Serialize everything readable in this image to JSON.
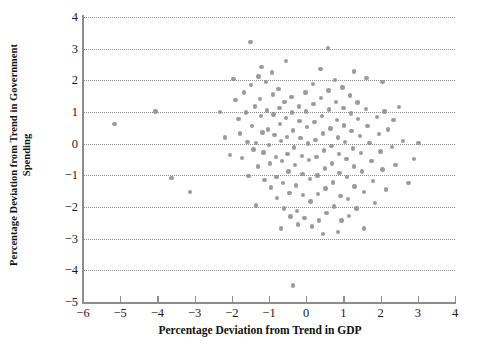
{
  "chart_data": {
    "type": "scatter",
    "title": "",
    "xlabel": "Percentage Deviation from Trend in GDP",
    "ylabel": "Percentage Deviation from Trend in Government Spending",
    "ylabel_line1": "Percentage Deviation from Trend in Government",
    "ylabel_line2": "Spending",
    "xlim": [
      -6,
      4
    ],
    "ylim": [
      -5,
      4
    ],
    "xticks": [
      -6,
      -5,
      -4,
      -3,
      -2,
      -1,
      0,
      1,
      2,
      3,
      4
    ],
    "yticks": [
      4,
      3,
      2,
      1,
      0,
      -1,
      -2,
      -3,
      -4,
      -5
    ],
    "xticklabels": [
      "−6",
      "−5",
      "−4",
      "−3",
      "−2",
      "−1",
      "0",
      "1",
      "2",
      "3",
      "4"
    ],
    "yticklabels": [
      "4",
      "3",
      "2",
      "1",
      "0",
      "−1",
      "−2",
      "−3",
      "−4",
      "−5"
    ],
    "grid": "horizontal-dotted",
    "legend": "none",
    "marker_color": "#8c8c94",
    "axis_color": "#8d8d8d",
    "grid_color": "#8a8a8a",
    "background": "#ffffff",
    "points": [
      [
        -5.15,
        0.62
      ],
      [
        -4.05,
        1.02
      ],
      [
        -3.62,
        -1.08
      ],
      [
        -3.12,
        -1.52
      ],
      [
        -2.32,
        1.0
      ],
      [
        -2.18,
        0.2
      ],
      [
        -2.05,
        -0.35
      ],
      [
        -1.95,
        2.05
      ],
      [
        -1.9,
        1.38
      ],
      [
        -1.82,
        0.78
      ],
      [
        -1.78,
        0.32
      ],
      [
        -1.72,
        -0.45
      ],
      [
        -1.68,
        1.62
      ],
      [
        -1.62,
        0.98
      ],
      [
        -1.58,
        0.05
      ],
      [
        -1.55,
        -1.02
      ],
      [
        -1.5,
        3.22
      ],
      [
        -1.48,
        1.85
      ],
      [
        -1.45,
        0.55
      ],
      [
        -1.42,
        -0.18
      ],
      [
        -1.38,
        1.18
      ],
      [
        -1.35,
        0.02
      ],
      [
        -1.3,
        -0.72
      ],
      [
        -1.28,
        2.12
      ],
      [
        -1.25,
        1.42
      ],
      [
        -1.22,
        0.88
      ],
      [
        -1.18,
        0.35
      ],
      [
        -1.15,
        -0.28
      ],
      [
        -1.12,
        -1.15
      ],
      [
        -1.08,
        1.95
      ],
      [
        -1.05,
        1.05
      ],
      [
        -1.02,
        0.45
      ],
      [
        -1.0,
        -0.05
      ],
      [
        -0.98,
        -0.62
      ],
      [
        -0.95,
        -1.38
      ],
      [
        -0.92,
        2.25
      ],
      [
        -0.9,
        1.55
      ],
      [
        -0.88,
        0.92
      ],
      [
        -0.85,
        0.28
      ],
      [
        -0.82,
        -0.42
      ],
      [
        -0.8,
        -1.05
      ],
      [
        -0.78,
        -1.72
      ],
      [
        -0.75,
        1.72
      ],
      [
        -0.72,
        1.12
      ],
      [
        -0.7,
        0.62
      ],
      [
        -0.68,
        0.08
      ],
      [
        -0.65,
        -0.55
      ],
      [
        -0.62,
        -1.25
      ],
      [
        -0.6,
        -2.05
      ],
      [
        -0.58,
        1.32
      ],
      [
        -0.55,
        0.82
      ],
      [
        -0.52,
        0.22
      ],
      [
        -0.5,
        -0.32
      ],
      [
        -0.48,
        -0.88
      ],
      [
        -0.45,
        -1.55
      ],
      [
        -0.42,
        -2.3
      ],
      [
        -0.4,
        1.48
      ],
      [
        -0.38,
        0.98
      ],
      [
        -0.35,
        0.42
      ],
      [
        -0.32,
        -0.12
      ],
      [
        -0.3,
        -0.68
      ],
      [
        -0.28,
        -1.32
      ],
      [
        -0.25,
        -2.12
      ],
      [
        -0.22,
        -2.55
      ],
      [
        -0.2,
        1.18
      ],
      [
        -0.18,
        0.72
      ],
      [
        -0.15,
        0.18
      ],
      [
        -0.12,
        -0.38
      ],
      [
        -0.1,
        -0.95
      ],
      [
        -0.08,
        -1.62
      ],
      [
        -0.05,
        -2.35
      ],
      [
        -0.35,
        -4.48
      ],
      [
        -0.02,
        1.62
      ],
      [
        0.0,
        1.02
      ],
      [
        0.02,
        0.52
      ],
      [
        0.05,
        0.0
      ],
      [
        0.08,
        -0.52
      ],
      [
        0.1,
        -1.12
      ],
      [
        0.12,
        -1.82
      ],
      [
        0.15,
        -2.62
      ],
      [
        0.18,
        1.88
      ],
      [
        0.2,
        1.25
      ],
      [
        0.22,
        0.68
      ],
      [
        0.25,
        0.12
      ],
      [
        0.28,
        -0.42
      ],
      [
        0.3,
        -1.0
      ],
      [
        0.32,
        -1.58
      ],
      [
        0.35,
        -2.42
      ],
      [
        0.38,
        2.35
      ],
      [
        0.4,
        1.45
      ],
      [
        0.42,
        0.88
      ],
      [
        0.45,
        0.32
      ],
      [
        0.48,
        -0.22
      ],
      [
        0.5,
        -0.78
      ],
      [
        0.52,
        -1.42
      ],
      [
        0.55,
        -2.18
      ],
      [
        0.58,
        3.02
      ],
      [
        0.6,
        1.68
      ],
      [
        0.62,
        1.08
      ],
      [
        0.65,
        0.48
      ],
      [
        0.68,
        -0.08
      ],
      [
        0.7,
        -0.62
      ],
      [
        0.72,
        -1.22
      ],
      [
        0.75,
        -1.98
      ],
      [
        0.78,
        2.02
      ],
      [
        0.8,
        1.32
      ],
      [
        0.82,
        0.75
      ],
      [
        0.85,
        0.2
      ],
      [
        0.88,
        -0.32
      ],
      [
        0.9,
        -0.92
      ],
      [
        0.92,
        -1.65
      ],
      [
        0.95,
        -2.42
      ],
      [
        0.98,
        1.78
      ],
      [
        1.0,
        1.12
      ],
      [
        1.02,
        0.58
      ],
      [
        1.05,
        0.05
      ],
      [
        1.08,
        -0.48
      ],
      [
        1.1,
        -1.05
      ],
      [
        1.12,
        -1.75
      ],
      [
        1.15,
        -2.28
      ],
      [
        1.18,
        1.52
      ],
      [
        1.2,
        0.95
      ],
      [
        1.22,
        0.4
      ],
      [
        1.25,
        -0.15
      ],
      [
        1.28,
        -0.72
      ],
      [
        1.3,
        -1.35
      ],
      [
        1.35,
        -2.05
      ],
      [
        1.38,
        1.3
      ],
      [
        1.4,
        0.78
      ],
      [
        1.45,
        0.25
      ],
      [
        1.48,
        -0.3
      ],
      [
        1.5,
        -0.88
      ],
      [
        1.55,
        -1.52
      ],
      [
        1.6,
        1.1
      ],
      [
        1.65,
        0.55
      ],
      [
        1.7,
        0.02
      ],
      [
        1.75,
        -0.55
      ],
      [
        1.8,
        -1.18
      ],
      [
        1.85,
        -1.88
      ],
      [
        1.9,
        0.85
      ],
      [
        1.95,
        0.3
      ],
      [
        2.0,
        -0.25
      ],
      [
        2.05,
        -0.82
      ],
      [
        2.1,
        1.02
      ],
      [
        2.15,
        -1.45
      ],
      [
        2.2,
        0.45
      ],
      [
        2.3,
        -0.1
      ],
      [
        2.4,
        -0.68
      ],
      [
        2.5,
        1.15
      ],
      [
        2.6,
        0.08
      ],
      [
        2.75,
        -1.25
      ],
      [
        2.9,
        -0.48
      ],
      [
        3.02,
        0.02
      ],
      [
        2.05,
        1.95
      ],
      [
        1.62,
        2.08
      ],
      [
        1.28,
        2.28
      ],
      [
        -1.2,
        2.42
      ],
      [
        0.85,
        -2.78
      ],
      [
        0.45,
        -2.85
      ],
      [
        1.55,
        -2.68
      ],
      [
        -0.68,
        -2.68
      ],
      [
        -1.35,
        -1.95
      ],
      [
        2.35,
        0.75
      ],
      [
        -0.55,
        2.62
      ]
    ]
  }
}
